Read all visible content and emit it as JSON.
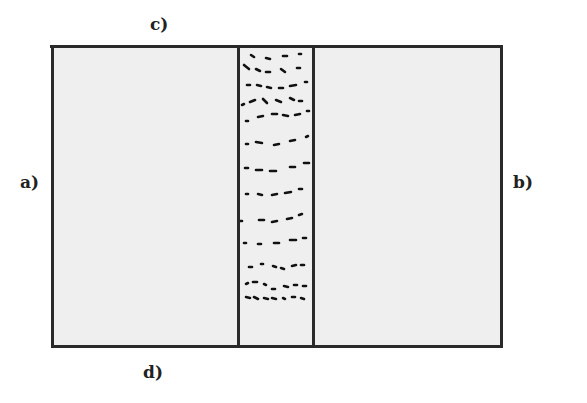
{
  "diagram": {
    "labels": {
      "a": "a)",
      "b": "b)",
      "c": "c)",
      "d": "d)"
    },
    "regions": [
      {
        "name": "left-panel",
        "fill": "#efefef"
      },
      {
        "name": "middle-stripe",
        "fill": "#efefef",
        "pattern": "dashes"
      },
      {
        "name": "right-panel",
        "fill": "#efefef"
      }
    ],
    "colors": {
      "line": "#2a2a2a",
      "fill": "#efefef",
      "background": "#ffffff"
    }
  }
}
